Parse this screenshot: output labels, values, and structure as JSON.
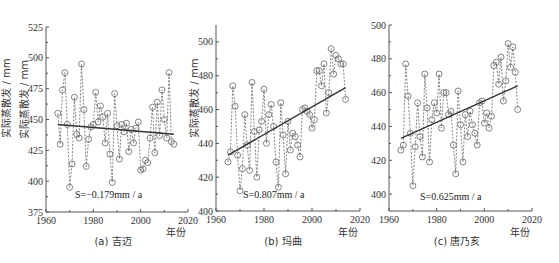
{
  "figure": {
    "ylabel": "实际蒸散发 / mm",
    "xlabel": "年份",
    "colors": {
      "axis": "#555555",
      "marker": "#666666",
      "trend": "#333333",
      "text": "#333333"
    }
  },
  "chart_data": [
    {
      "type": "line",
      "id": "a",
      "caption": "(a) 吉迈",
      "title": "吉迈",
      "xlabel": "年份",
      "ylabel": "实际蒸散发 / mm",
      "xlim": [
        1960,
        2020
      ],
      "ylim": [
        375,
        525
      ],
      "xticks": [
        1960,
        1980,
        2000,
        2020
      ],
      "yticks": [
        375,
        400,
        425,
        450,
        475,
        500,
        525
      ],
      "annotation": "S=−0.179mm / a",
      "trend": {
        "slope": -0.179,
        "start": [
          1965,
          446
        ],
        "end": [
          2014,
          438
        ]
      },
      "x": [
        1965,
        1966,
        1967,
        1968,
        1969,
        1970,
        1971,
        1972,
        1973,
        1974,
        1975,
        1976,
        1977,
        1978,
        1979,
        1980,
        1981,
        1982,
        1983,
        1984,
        1985,
        1986,
        1987,
        1988,
        1989,
        1990,
        1991,
        1992,
        1993,
        1994,
        1995,
        1996,
        1997,
        1998,
        1999,
        2000,
        2001,
        2002,
        2003,
        2004,
        2005,
        2006,
        2007,
        2008,
        2009,
        2010,
        2011,
        2012,
        2013,
        2014
      ],
      "values": [
        455,
        430,
        474,
        488,
        446,
        395,
        414,
        468,
        438,
        435,
        495,
        458,
        412,
        434,
        444,
        446,
        472,
        448,
        461,
        452,
        431,
        455,
        422,
        399,
        471,
        445,
        418,
        446,
        440,
        447,
        424,
        442,
        431,
        443,
        448,
        409,
        410,
        417,
        415,
        435,
        460,
        423,
        464,
        437,
        474,
        450,
        435,
        488,
        432,
        430
      ]
    },
    {
      "type": "line",
      "id": "b",
      "caption": "(b) 玛曲",
      "title": "玛曲",
      "xlabel": "年份",
      "ylabel": "实际蒸散发 / mm",
      "xlim": [
        1960,
        2020
      ],
      "ylim": [
        400,
        510
      ],
      "xticks": [
        1960,
        1980,
        2000,
        2020
      ],
      "yticks": [
        400,
        420,
        440,
        460,
        480,
        500
      ],
      "annotation": "S=0.807mm / a",
      "trend": {
        "slope": 0.807,
        "start": [
          1965,
          433
        ],
        "end": [
          2014,
          473
        ]
      },
      "x": [
        1965,
        1966,
        1967,
        1968,
        1969,
        1970,
        1971,
        1972,
        1973,
        1974,
        1975,
        1976,
        1977,
        1978,
        1979,
        1980,
        1981,
        1982,
        1983,
        1984,
        1985,
        1986,
        1987,
        1988,
        1989,
        1990,
        1991,
        1992,
        1993,
        1994,
        1995,
        1996,
        1997,
        1998,
        1999,
        2000,
        2001,
        2002,
        2003,
        2004,
        2005,
        2006,
        2007,
        2008,
        2009,
        2010,
        2011,
        2012,
        2013,
        2014
      ],
      "values": [
        429,
        435,
        474,
        462,
        433,
        412,
        425,
        457,
        439,
        424,
        476,
        447,
        420,
        448,
        453,
        472,
        440,
        457,
        463,
        450,
        429,
        414,
        464,
        445,
        422,
        453,
        436,
        446,
        444,
        439,
        432,
        460,
        461,
        459,
        457,
        449,
        454,
        483,
        483,
        474,
        487,
        458,
        470,
        496,
        481,
        492,
        490,
        487,
        487,
        466
      ]
    },
    {
      "type": "line",
      "id": "c",
      "caption": "(c) 唐乃亥",
      "title": "唐乃亥",
      "xlabel": "年份",
      "ylabel": "实际蒸散发 / mm",
      "xlim": [
        1960,
        2020
      ],
      "ylim": [
        390,
        500
      ],
      "xticks": [
        1960,
        1980,
        2000,
        2020
      ],
      "yticks": [
        400,
        420,
        440,
        460,
        480,
        500
      ],
      "annotation": "S=0.625mm / a",
      "trend": {
        "slope": 0.625,
        "start": [
          1965,
          433
        ],
        "end": [
          2014,
          464
        ]
      },
      "x": [
        1965,
        1966,
        1967,
        1968,
        1969,
        1970,
        1971,
        1972,
        1973,
        1974,
        1975,
        1976,
        1977,
        1978,
        1979,
        1980,
        1981,
        1982,
        1983,
        1984,
        1985,
        1986,
        1987,
        1988,
        1989,
        1990,
        1991,
        1992,
        1993,
        1994,
        1995,
        1996,
        1997,
        1998,
        1999,
        2000,
        2001,
        2002,
        2003,
        2004,
        2005,
        2006,
        2007,
        2008,
        2009,
        2010,
        2011,
        2012,
        2013,
        2014
      ],
      "values": [
        426,
        429,
        477,
        458,
        436,
        405,
        428,
        454,
        434,
        422,
        471,
        451,
        419,
        444,
        454,
        448,
        471,
        439,
        460,
        460,
        447,
        449,
        429,
        412,
        461,
        441,
        419,
        447,
        434,
        449,
        441,
        436,
        429,
        454,
        455,
        442,
        448,
        439,
        446,
        476,
        478,
        465,
        481,
        455,
        467,
        489,
        475,
        487,
        472,
        450
      ]
    }
  ]
}
